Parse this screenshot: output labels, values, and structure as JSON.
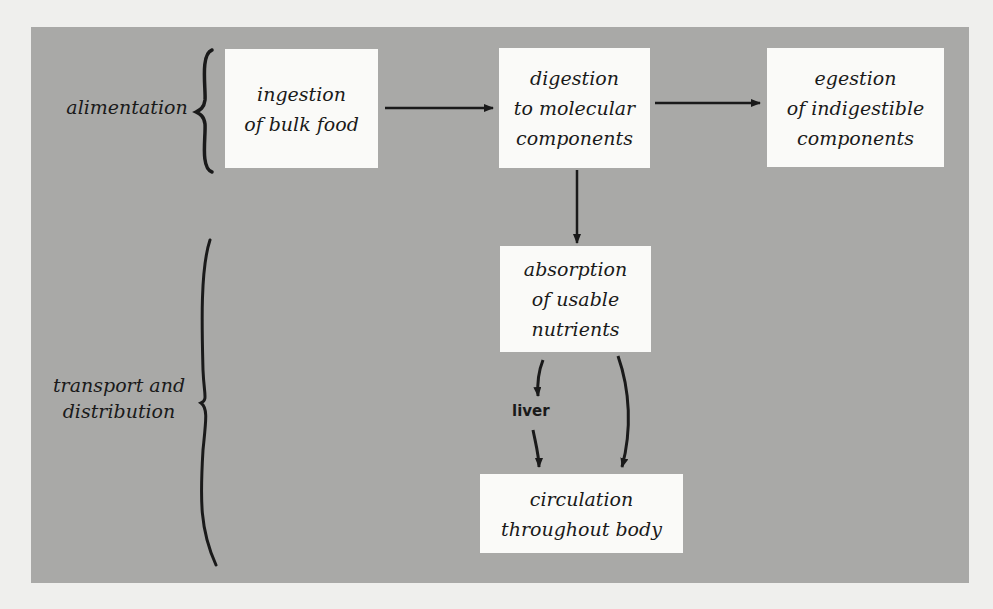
{
  "diagram": {
    "groups": [
      {
        "id": "alimentation",
        "label": "alimentation"
      },
      {
        "id": "transport",
        "label_line1": "transport and",
        "label_line2": "distribution"
      }
    ],
    "nodes": {
      "ingestion": {
        "line1": "ingestion",
        "line2": "of bulk food"
      },
      "digestion": {
        "line1": "digestion",
        "line2": "to molecular",
        "line3": "components"
      },
      "egestion": {
        "line1": "egestion",
        "line2": "of indigestible",
        "line3": "components"
      },
      "absorption": {
        "line1": "absorption",
        "line2": "of usable",
        "line3": "nutrients"
      },
      "circulation": {
        "line1": "circulation",
        "line2": "throughout body"
      }
    },
    "edges": [
      {
        "from": "ingestion",
        "to": "digestion"
      },
      {
        "from": "digestion",
        "to": "egestion"
      },
      {
        "from": "digestion",
        "to": "absorption"
      },
      {
        "from": "absorption",
        "to": "circulation",
        "via": "liver"
      },
      {
        "from": "absorption",
        "to": "circulation"
      }
    ],
    "edge_label_liver": "liver",
    "colors": {
      "panel": "#a9a9a7",
      "box": "#fafaf8",
      "ink": "#1a1a1a",
      "page": "#efefed"
    }
  }
}
